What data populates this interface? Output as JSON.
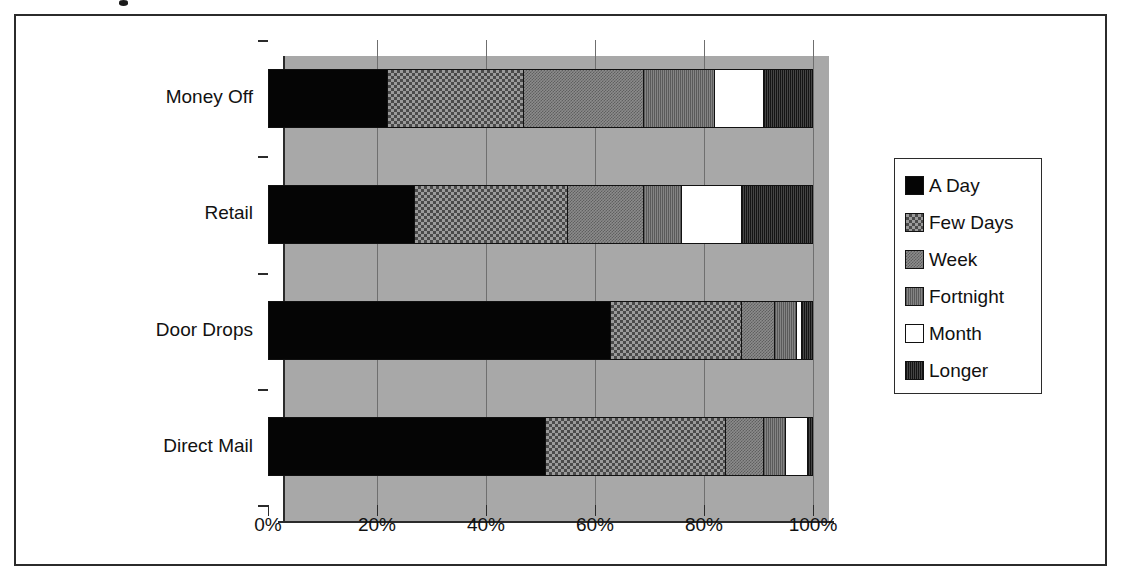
{
  "chart_data": {
    "type": "bar",
    "orientation": "horizontal",
    "stacked": true,
    "stack_mode": "percent",
    "title": "",
    "xlabel": "",
    "ylabel": "",
    "xlim": [
      0,
      100
    ],
    "xticks": [
      "0%",
      "20%",
      "40%",
      "60%",
      "80%",
      "100%"
    ],
    "xtick_values": [
      0,
      20,
      40,
      60,
      80,
      100
    ],
    "grid": true,
    "legend_position": "right",
    "categories": [
      "Money Off",
      "Retail",
      "Door Drops",
      "Direct Mail"
    ],
    "series": [
      {
        "name": "A Day",
        "pattern": "solid-black",
        "values": [
          22,
          27,
          63,
          51
        ]
      },
      {
        "name": "Few Days",
        "pattern": "checkerboard",
        "values": [
          25,
          28,
          24,
          33
        ]
      },
      {
        "name": "Week",
        "pattern": "fine-checker",
        "values": [
          22,
          14,
          6,
          7
        ]
      },
      {
        "name": "Fortnight",
        "pattern": "vertical-hatch",
        "values": [
          13,
          7,
          4,
          4
        ]
      },
      {
        "name": "Month",
        "pattern": "solid-white",
        "values": [
          9,
          11,
          1,
          4
        ]
      },
      {
        "name": "Longer",
        "pattern": "dark-hatch",
        "values": [
          9,
          13,
          2,
          1
        ]
      }
    ]
  },
  "legend": {
    "items": [
      {
        "label": "A Day"
      },
      {
        "label": "Few Days"
      },
      {
        "label": "Week"
      },
      {
        "label": "Fortnight"
      },
      {
        "label": "Month"
      },
      {
        "label": "Longer"
      }
    ]
  },
  "axis": {
    "x_tick_labels": [
      "0%",
      "20%",
      "40%",
      "60%",
      "80%",
      "100%"
    ],
    "y_category_labels": [
      "Money Off",
      "Retail",
      "Door Drops",
      "Direct Mail"
    ]
  }
}
